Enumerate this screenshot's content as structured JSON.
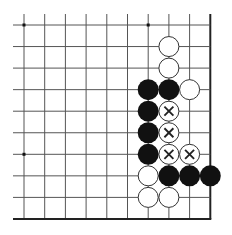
{
  "board": {
    "origin": [
      24,
      25
    ],
    "spacing": [
      20.7,
      21.55
    ],
    "columns": 10,
    "rows": 10,
    "line_extend_left": 13,
    "line_extend_top": 14,
    "right_edge": true,
    "bottom_edge": true,
    "colors": {
      "line": "#555555",
      "edge": "#222222",
      "black": "#111111",
      "white": "#ffffff"
    }
  },
  "star_points": [
    [
      0,
      0
    ],
    [
      6,
      0
    ],
    [
      0,
      6
    ]
  ],
  "stones": {
    "white": [
      [
        7,
        1
      ],
      [
        7,
        2
      ],
      [
        8,
        3
      ],
      [
        6,
        7
      ],
      [
        6,
        8
      ],
      [
        7,
        8
      ]
    ],
    "black": [
      [
        6,
        3
      ],
      [
        7,
        3
      ],
      [
        6,
        4
      ],
      [
        6,
        5
      ],
      [
        6,
        6
      ],
      [
        7,
        7
      ],
      [
        8,
        7
      ],
      [
        9,
        7
      ]
    ],
    "white_marked_x": [
      [
        7,
        4
      ],
      [
        7,
        5
      ],
      [
        7,
        6
      ],
      [
        8,
        6
      ]
    ]
  }
}
